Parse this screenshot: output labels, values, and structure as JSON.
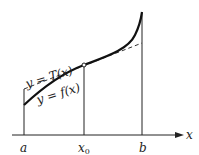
{
  "diagram": {
    "axis_label": "x",
    "tick_labels": {
      "a": "a",
      "x0": "x",
      "x0_sub": "0",
      "b": "b"
    },
    "tangent_label": "y = T(x)",
    "function_label": "y = f(x)",
    "colors": {
      "stroke": "#222222",
      "background": "#ffffff"
    }
  }
}
